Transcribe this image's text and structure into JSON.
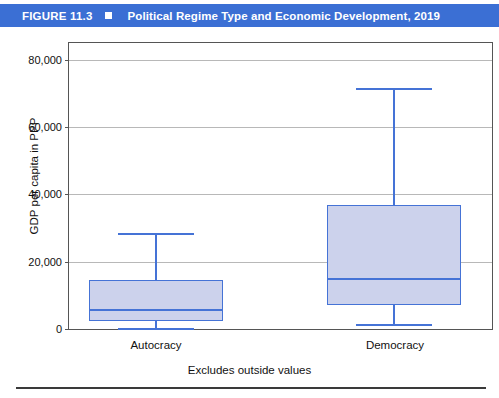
{
  "figure": {
    "number": "FIGURE 11.3",
    "bullet_icon": "square-bullet-icon",
    "caption": "Political Regime Type and Economic Development, 2019"
  },
  "colors": {
    "title_band": "#3b6fd4",
    "title_text": "#ffffff",
    "box_fill": "#ccd2ec",
    "box_stroke": "#4573d6",
    "gridline": "#b8b8b8",
    "frame": "#555555"
  },
  "chart_data": {
    "type": "box",
    "title": "Political Regime Type and Economic Development, 2019",
    "xlabel": "",
    "ylabel": "GDP per capita in PPP",
    "caption": "Excludes outside values",
    "categories": [
      "Autocracy",
      "Democracy"
    ],
    "ylim": [
      0,
      85000
    ],
    "yticks": [
      0,
      20000,
      40000,
      60000,
      80000
    ],
    "ytick_labels": [
      "0",
      "20,000",
      "40,000",
      "60,000",
      "80,000"
    ],
    "grid": true,
    "legend": "none",
    "boxes": [
      {
        "category": "Autocracy",
        "whisker_low": 300,
        "q1": 2400,
        "median": 5800,
        "q3": 14600,
        "whisker_high": 28400
      },
      {
        "category": "Democracy",
        "whisker_low": 1500,
        "q1": 7200,
        "median": 15300,
        "q3": 36800,
        "whisker_high": 71600
      }
    ]
  }
}
